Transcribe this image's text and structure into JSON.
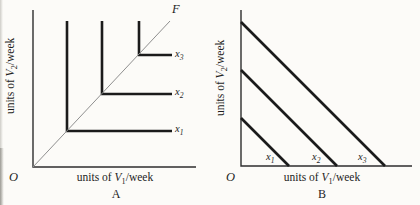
{
  "figure": {
    "background_color": "#fcfbf8",
    "line_color": "#1b1b1b",
    "axis_color": "#2e2e2e",
    "ray_color": "#8f8f8f"
  },
  "panel_a": {
    "panel_label": "A",
    "origin_label": "O",
    "ray_label": "F",
    "x_axis_label": {
      "prefix": "units of ",
      "variable": "V",
      "subscript": "1",
      "suffix": "/week"
    },
    "y_axis_label": {
      "prefix": "units of ",
      "variable": "V",
      "subscript": "2",
      "suffix": "/week"
    },
    "isoquant_labels": [
      {
        "variable": "x",
        "subscript": "1"
      },
      {
        "variable": "x",
        "subscript": "2"
      },
      {
        "variable": "x",
        "subscript": "3"
      }
    ]
  },
  "panel_b": {
    "panel_label": "B",
    "origin_label": "O",
    "x_axis_label": {
      "prefix": "units of ",
      "variable": "V",
      "subscript": "1",
      "suffix": "/week"
    },
    "y_axis_label": {
      "prefix": "units of ",
      "variable": "V",
      "subscript": "2",
      "suffix": "/week"
    },
    "isoquant_labels": [
      {
        "variable": "x",
        "subscript": "1"
      },
      {
        "variable": "x",
        "subscript": "2"
      },
      {
        "variable": "x",
        "subscript": "3"
      }
    ]
  },
  "chart_data": [
    {
      "panel": "A",
      "type": "line",
      "title": "",
      "xlabel": "units of V1/week",
      "ylabel": "units of V2/week",
      "description": "Fixed-proportions (L-shaped) isoquants x1 < x2 < x3 with corners lying on ray OF from the origin",
      "grid": false,
      "legend": false,
      "axis_ranges": {
        "x": [
          0,
          4.6
        ],
        "y": [
          0,
          4.5
        ]
      },
      "series": [
        {
          "name": "x1",
          "kind": "isoquant",
          "points": [
            [
              1,
              4.15
            ],
            [
              1,
              1
            ],
            [
              3.95,
              1
            ]
          ]
        },
        {
          "name": "x2",
          "kind": "isoquant",
          "points": [
            [
              2,
              4.15
            ],
            [
              2,
              2
            ],
            [
              3.95,
              2
            ]
          ]
        },
        {
          "name": "x3",
          "kind": "isoquant",
          "points": [
            [
              3,
              4.15
            ],
            [
              3,
              3
            ],
            [
              3.95,
              3
            ]
          ]
        },
        {
          "name": "OF",
          "kind": "ray",
          "points": [
            [
              0,
              0
            ],
            [
              3.9,
              4.15
            ]
          ]
        }
      ],
      "pixel_geometry": {
        "origin": [
          33,
          167
        ],
        "x_axis_end": [
          196,
          167
        ],
        "y_axis_end": [
          33,
          10
        ],
        "series_px": [
          [
            [
              67,
              21
            ],
            [
              67,
              131
            ],
            [
              172,
              131
            ]
          ],
          [
            [
              102,
              21
            ],
            [
              102,
              94
            ],
            [
              172,
              94
            ]
          ],
          [
            [
              139,
              21
            ],
            [
              139,
              55
            ],
            [
              172,
              55
            ]
          ],
          [
            [
              33,
              167
            ],
            [
              170,
              21
            ]
          ]
        ]
      }
    },
    {
      "panel": "B",
      "type": "line",
      "title": "",
      "xlabel": "units of V1/week",
      "ylabel": "units of V2/week",
      "description": "Perfect-substitutes (linear, slope -1) isoquants x1 < x2 < x3 with intercepts in ratio 1:2:3",
      "grid": false,
      "legend": false,
      "axis_ranges": {
        "x": [
          0,
          3.6
        ],
        "y": [
          0,
          3.3
        ]
      },
      "series": [
        {
          "name": "x1",
          "kind": "isoquant",
          "points": [
            [
              0,
              1
            ],
            [
              1,
              0
            ]
          ]
        },
        {
          "name": "x2",
          "kind": "isoquant",
          "points": [
            [
              0,
              2
            ],
            [
              2,
              0
            ]
          ]
        },
        {
          "name": "x3",
          "kind": "isoquant",
          "points": [
            [
              0,
              3
            ],
            [
              3,
              0
            ]
          ]
        }
      ],
      "pixel_geometry": {
        "origin": [
          241,
          166
        ],
        "x_axis_end": [
          412,
          166
        ],
        "y_axis_end": [
          241,
          10
        ],
        "series_px": [
          [
            [
              241,
              118
            ],
            [
              289,
              166
            ]
          ],
          [
            [
              241,
              70
            ],
            [
              337,
              166
            ]
          ],
          [
            [
              241,
              22
            ],
            [
              385,
              166
            ]
          ]
        ]
      }
    }
  ]
}
